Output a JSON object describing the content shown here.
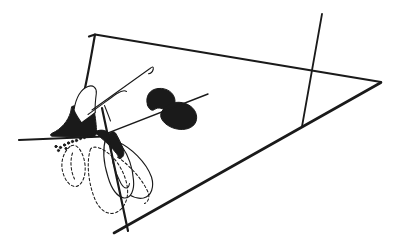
{
  "page": {
    "background_color": "#ffffff",
    "width": 397,
    "height": 250
  },
  "figure": {
    "type": "line-drawing",
    "ink_color": "#1a1a1a",
    "paper_color": "#ffffff",
    "canvas": {
      "width": 397,
      "height": 250
    },
    "defaults": {
      "stroke": "#1a1a1a",
      "fill": "none",
      "stroke-linecap": "round",
      "stroke-linejoin": "round"
    },
    "elements": [
      {
        "name": "plane-top-edge",
        "tag": "path",
        "attrs": {
          "d": "M 89 36.5 L 95 34.5 L 381 82",
          "stroke-width": "2.2"
        }
      },
      {
        "name": "plane-left-edge",
        "tag": "path",
        "attrs": {
          "d": "M 95 34.5 C 91 57 86.5 84 82 101",
          "stroke-width": "2.2"
        }
      },
      {
        "name": "plane-bottom-edge",
        "tag": "path",
        "attrs": {
          "d": "M 114 233 L 381 82.5",
          "stroke-width": "2.6"
        }
      },
      {
        "name": "crossing-line",
        "tag": "path",
        "attrs": {
          "d": "M 322 14 L 302 126.5",
          "stroke-width": "1.8"
        }
      },
      {
        "name": "baseline-left",
        "tag": "path",
        "attrs": {
          "d": "M 19 140 L 103 136.5",
          "stroke-width": "2.2"
        }
      },
      {
        "name": "upper-viscidium-funnel",
        "tag": "path",
        "attrs": {
          "d": "M 72 106.5 C 79 103.5 89 105 94 109.5 C 95.5 117.5 96.5 126.5 96.5 132 C 96.5 135.5 94 137 91 136.8 L 52 136.2 C 50 135.7 50 134.3 52 133.3 C 61.5 129 68 121 70.5 112.5 Z",
          "fill": "#1a1a1a",
          "stroke-width": "1"
        }
      },
      {
        "name": "upper-pollinium-loop",
        "tag": "path",
        "attrs": {
          "d": "M 74 110 C 76 97.5 81.5 89 88 86.5 C 93 84.5 97 88 96.3 93.5 C 95.3 101 94.8 107 95.3 112.5 C 90.5 116.5 85.5 119.8 81.5 123 C 78.5 118.5 75.5 114.5 74 110 Z",
          "fill": "#ffffff",
          "stroke-width": "1.1"
        }
      },
      {
        "name": "bristle-long",
        "tag": "path",
        "attrs": {
          "d": "M 92 110 Q 122 88.5 150 68.5 Q 154 65 153.2 69.5 Q 152 73.5 148.5 73.8",
          "stroke-width": "1.1"
        }
      },
      {
        "name": "bristle-short",
        "tag": "path",
        "attrs": {
          "d": "M 88 114.5 C 98 107.5 108.5 99.5 117 93.5 C 121 91 124.5 90 126.5 91.5",
          "stroke-width": "1.05"
        }
      },
      {
        "name": "bristle-crossing",
        "tag": "path",
        "attrs": {
          "d": "M 104.5 105.5 C 106.5 110.5 108.5 115.5 110.5 121",
          "stroke-width": "1.05"
        }
      },
      {
        "name": "pollinium-lobe-upper",
        "tag": "path",
        "attrs": {
          "d": "M 147.5 105 C 145 96.5 149.5 89.5 158 88.5 C 167 87.5 174.5 93 175 100.5 C 175.3 106.5 171.5 111.5 166.5 112 C 163.5 108.5 158.5 106.5 154.5 109.5 C 151.5 111.7 148.5 108.5 147.5 105 Z",
          "fill": "#1a1a1a",
          "stroke-width": "1"
        }
      },
      {
        "name": "pollinium-lobe-lower",
        "tag": "path",
        "attrs": {
          "d": "M 162.5 110.5 C 167.5 103 177 100.5 185.5 103.5 C 193.5 106.5 197.5 113 196.5 119.5 C 195.3 126.5 188 130.3 179 129.3 C 170 128.3 163 123 161 117.5 C 160.2 114.7 161 112.3 162.5 110.5 Z",
          "fill": "#1a1a1a",
          "stroke-width": "1"
        }
      },
      {
        "name": "stipe-line",
        "tag": "path",
        "attrs": {
          "d": "M 100.5 135.8 L 208 94",
          "stroke-width": "1.4"
        }
      },
      {
        "name": "lower-petal-outer",
        "tag": "path",
        "attrs": {
          "d": "M 117 141.5 C 131 147.5 146 162 151.5 177 C 154.5 187 151.5 196 143.5 198 C 133.5 200 124 192 118 183 C 113 175 111 161 112 151 Z",
          "fill": "#ffffff",
          "stroke-width": "1.15"
        }
      },
      {
        "name": "lower-petal",
        "tag": "path",
        "attrs": {
          "d": "M 106 137.5 C 102.5 148.5 103.5 163 108 177 C 111.5 189 117 196.5 124 198 C 131 198.5 134.5 190 133.5 180 C 132.5 168 128 155 122 146.5 C 117.5 140.5 111.5 137 106 137.5 Z",
          "fill": "#ffffff",
          "stroke-width": "1.15"
        }
      },
      {
        "name": "lower-petal-fold",
        "tag": "path",
        "attrs": {
          "d": "M 111.5 141.5 C 110.5 155 114 171 121 183.5 C 124.5 189.5 128.5 189.5 129.5 183.5",
          "stroke-width": "1.05"
        }
      },
      {
        "name": "lower-viscidium-claw",
        "tag": "path",
        "attrs": {
          "d": "M 95.5 131.5 C 100.5 129 106 130 109.5 133.5 C 111.5 131.5 113.5 131 115.5 133 C 118.5 138 121.5 144 123.5 150 C 124.5 154 123.5 157.5 120 158.5 C 115.5 151.5 109.5 145 103.5 140 C 99.5 136.5 96.5 134 95.5 131.5 Z",
          "fill": "#1a1a1a",
          "stroke-width": "1"
        }
      },
      {
        "name": "inner-steep-line",
        "tag": "path",
        "attrs": {
          "d": "M 102 108 L 128 231",
          "stroke-width": "2.2"
        }
      },
      {
        "name": "dashed-teardrop",
        "tag": "path",
        "attrs": {
          "d": "M 70 146.5 C 63.5 152 60.5 161.5 62.5 171 C 64.5 179.5 69 185.5 74.5 186.5 C 79.5 187 84 181 85 172.5 C 86 162.5 83 152.5 78 147.5 C 75.5 144.8 72.5 144.5 70 146.5 Z",
          "stroke-width": "1.05",
          "stroke-dasharray": "2.6 2.3"
        }
      },
      {
        "name": "dashed-teardrop-inner",
        "tag": "path",
        "attrs": {
          "d": "M 72.5 153 C 70 161 70.5 170.5 74.5 179",
          "stroke-width": "1.05",
          "stroke-dasharray": "2.6 2.3"
        }
      },
      {
        "name": "dashed-loop",
        "tag": "path",
        "attrs": {
          "d": "M 90.5 149 C 86 163 88.5 184.5 95.5 200.5 C 100.5 211 108.5 215.5 116 212.5 C 124 209 128.5 199.5 127.5 188.5 C 126 176 119.5 163.5 111.5 156 C 103.5 148.5 94.5 144.5 90.5 149 Z",
          "stroke-width": "1.05",
          "stroke-dasharray": "2.6 2.3"
        }
      },
      {
        "name": "dashed-arc",
        "tag": "path",
        "attrs": {
          "d": "M 117.5 157 C 129.5 165.5 141 177.5 147.5 191 C 150 196.5 149 201.5 144.5 203.5",
          "stroke-width": "1.05",
          "stroke-dasharray": "2.6 2.3"
        }
      },
      {
        "name": "viscidium-dot",
        "tag": "circle",
        "attrs": {
          "cx": "56",
          "cy": "146.5",
          "r": "1.15",
          "fill": "#1a1a1a"
        }
      },
      {
        "name": "viscidium-dot",
        "tag": "circle",
        "attrs": {
          "cx": "60.5",
          "cy": "147.5",
          "r": "1.15",
          "fill": "#1a1a1a"
        }
      },
      {
        "name": "viscidium-dot",
        "tag": "circle",
        "attrs": {
          "cx": "58.5",
          "cy": "150.5",
          "r": "1.1",
          "fill": "#1a1a1a"
        }
      },
      {
        "name": "viscidium-dot",
        "tag": "circle",
        "attrs": {
          "cx": "64.5",
          "cy": "145",
          "r": "1.15",
          "fill": "#1a1a1a"
        }
      },
      {
        "name": "viscidium-dot",
        "tag": "circle",
        "attrs": {
          "cx": "66",
          "cy": "148.5",
          "r": "1.1",
          "fill": "#1a1a1a"
        }
      },
      {
        "name": "viscidium-dot",
        "tag": "circle",
        "attrs": {
          "cx": "68.5",
          "cy": "143",
          "r": "1.15",
          "fill": "#1a1a1a"
        }
      },
      {
        "name": "viscidium-dot",
        "tag": "circle",
        "attrs": {
          "cx": "72.5",
          "cy": "141.5",
          "r": "1.15",
          "fill": "#1a1a1a"
        }
      },
      {
        "name": "viscidium-dot",
        "tag": "circle",
        "attrs": {
          "cx": "76.5",
          "cy": "140.5",
          "r": "1.15",
          "fill": "#1a1a1a"
        }
      },
      {
        "name": "viscidium-dot",
        "tag": "circle",
        "attrs": {
          "cx": "80.5",
          "cy": "138.5",
          "r": "1.15",
          "fill": "#1a1a1a"
        }
      },
      {
        "name": "viscidium-dot",
        "tag": "circle",
        "attrs": {
          "cx": "84.5",
          "cy": "137.5",
          "r": "1.15",
          "fill": "#1a1a1a"
        }
      },
      {
        "name": "viscidium-dot",
        "tag": "circle",
        "attrs": {
          "cx": "88.5",
          "cy": "136",
          "r": "1.15",
          "fill": "#1a1a1a"
        }
      },
      {
        "name": "viscidium-dot",
        "tag": "circle",
        "attrs": {
          "cx": "92.5",
          "cy": "134.5",
          "r": "1.15",
          "fill": "#1a1a1a"
        }
      },
      {
        "name": "viscidium-dot",
        "tag": "circle",
        "attrs": {
          "cx": "96.5",
          "cy": "133",
          "r": "1.1",
          "fill": "#1a1a1a"
        }
      }
    ]
  }
}
